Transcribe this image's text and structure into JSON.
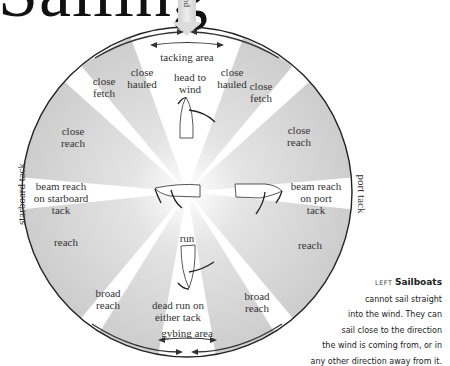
{
  "title": "Sailing",
  "wind_label": "wind",
  "circle": {
    "cx": 187,
    "cy": 192,
    "r": 165,
    "stroke": "#222222",
    "sector_color": "#c8c8c8"
  },
  "areas": {
    "tacking": "tacking area",
    "gybing": "gybing area"
  },
  "tacks": {
    "starboard": "starboard tack",
    "port": "port tack"
  },
  "points_of_sail": {
    "head_to_wind": "head to\nwind",
    "close_hauled_left": "close\nhauled",
    "close_hauled_right": "close\nhauled",
    "close_fetch_left": "close\nfetch",
    "close_fetch_right": "close\nfetch",
    "close_reach_left": "close\nreach",
    "close_reach_right": "close\nreach",
    "beam_reach_starboard": "beam reach\non starboard\ntack",
    "beam_reach_port": "beam reach\non port\ntack",
    "reach_left": "reach",
    "reach_right": "reach",
    "broad_reach_left": "broad\nreach",
    "broad_reach_right": "broad\nreach",
    "run": "run",
    "dead_run": "dead run on\neither tack"
  },
  "caption": {
    "kicker": "LEFT",
    "lead": "Sailboats",
    "lines": [
      "cannot sail straight",
      "into the wind. They can",
      "sail close to the direction",
      "the wind is coming from, or in",
      "any other direction away from it."
    ]
  }
}
